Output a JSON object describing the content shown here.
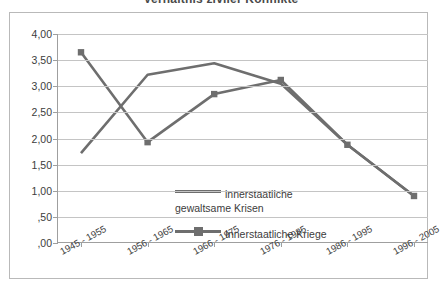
{
  "title": "Verhältnis ziviler Konflikte",
  "chart_data": {
    "type": "line",
    "title": "Verhältnis ziviler Konflikte",
    "xlabel": "",
    "ylabel": "",
    "ylim": [
      0,
      4
    ],
    "ytick_labels": [
      "4,00",
      "3,50",
      "3,00",
      "2,50",
      "2,00",
      "1,50",
      "1,00",
      ",50",
      ",00"
    ],
    "ytick_values": [
      4.0,
      3.5,
      3.0,
      2.5,
      2.0,
      1.5,
      1.0,
      0.5,
      0.0
    ],
    "grid": true,
    "legend_position": "inside-center",
    "categories": [
      "1945 - 1955",
      "1956 - 1965",
      "1966 - 1975",
      "1976 - 1985",
      "1986 - 1995",
      "1996 - 2005"
    ],
    "series": [
      {
        "name": "innerstaatliche gewaltsame Krisen",
        "name_line1": "innerstaatliche",
        "name_line2": "gewaltsame Krisen",
        "marker": "none",
        "color": "#6e6e6e",
        "values": [
          1.72,
          3.22,
          3.44,
          3.05,
          1.88,
          0.9
        ]
      },
      {
        "name": "Innerstaatliche Kriege",
        "name_line1": "Innerstaatliche Kriege",
        "name_line2": "",
        "marker": "square",
        "color": "#6e6e6e",
        "values": [
          3.65,
          1.93,
          2.85,
          3.12,
          1.88,
          0.9
        ]
      }
    ]
  }
}
